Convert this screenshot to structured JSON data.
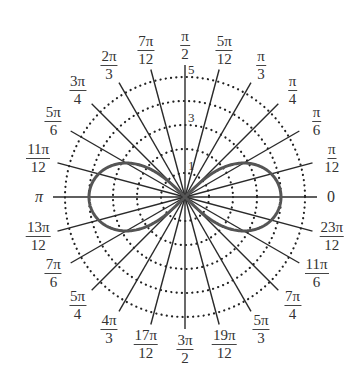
{
  "chart_data": {
    "type": "polar",
    "title": "",
    "curve": {
      "equation": "r^2 = 16 cos(2θ)",
      "shape": "lemniscate",
      "max_r": 4,
      "color": "#555555"
    },
    "radial_axis": {
      "range": [
        0,
        5
      ],
      "rings": [
        1,
        2,
        3,
        4,
        5
      ],
      "ring_style": "dotted",
      "tick_labels": [
        "1",
        "3",
        "5"
      ]
    },
    "angular_axis": {
      "step": "π/12",
      "labels": [
        {
          "angle_deg": 0,
          "num": "0",
          "den": ""
        },
        {
          "angle_deg": 15,
          "num": "π",
          "den": "12"
        },
        {
          "angle_deg": 30,
          "num": "π",
          "den": "6"
        },
        {
          "angle_deg": 45,
          "num": "π",
          "den": "4"
        },
        {
          "angle_deg": 60,
          "num": "π",
          "den": "3"
        },
        {
          "angle_deg": 75,
          "num": "5π",
          "den": "12"
        },
        {
          "angle_deg": 90,
          "num": "π",
          "den": "2"
        },
        {
          "angle_deg": 105,
          "num": "7π",
          "den": "12"
        },
        {
          "angle_deg": 120,
          "num": "2π",
          "den": "3"
        },
        {
          "angle_deg": 135,
          "num": "3π",
          "den": "4"
        },
        {
          "angle_deg": 150,
          "num": "5π",
          "den": "6"
        },
        {
          "angle_deg": 165,
          "num": "11π",
          "den": "12"
        },
        {
          "angle_deg": 180,
          "num": "π",
          "den": ""
        },
        {
          "angle_deg": 195,
          "num": "13π",
          "den": "12"
        },
        {
          "angle_deg": 210,
          "num": "7π",
          "den": "6"
        },
        {
          "angle_deg": 225,
          "num": "5π",
          "den": "4"
        },
        {
          "angle_deg": 240,
          "num": "4π",
          "den": "3"
        },
        {
          "angle_deg": 255,
          "num": "17π",
          "den": "12"
        },
        {
          "angle_deg": 270,
          "num": "3π",
          "den": "2"
        },
        {
          "angle_deg": 285,
          "num": "19π",
          "den": "12"
        },
        {
          "angle_deg": 300,
          "num": "5π",
          "den": "3"
        },
        {
          "angle_deg": 315,
          "num": "7π",
          "den": "4"
        },
        {
          "angle_deg": 330,
          "num": "11π",
          "den": "6"
        },
        {
          "angle_deg": 345,
          "num": "23π",
          "den": "12"
        }
      ]
    },
    "grid": true,
    "legend": null
  }
}
